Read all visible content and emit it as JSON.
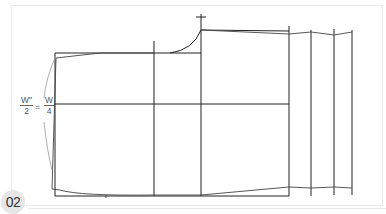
{
  "figure": {
    "number_badge": "02",
    "formula": {
      "left_num": "W\"",
      "left_den": "2",
      "equals": "=",
      "right_num": "W",
      "right_den": "4"
    },
    "colors": {
      "line": "#222222",
      "thin_line": "#555555",
      "guide_curve": "#888888",
      "badge_bg": "#e6e6e6",
      "frame_border": "#ececec"
    }
  }
}
